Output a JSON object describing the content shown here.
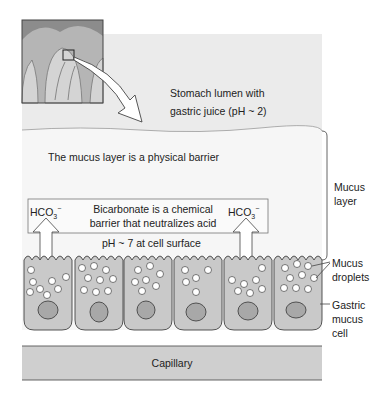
{
  "labels": {
    "lumen_line1": "Stomach lumen with",
    "lumen_line2": "gastric juice (pH ~ 2)",
    "mucus_barrier": "The mucus layer is a physical barrier",
    "bicarb_line1": "Bicarbonate is a chemical",
    "bicarb_line2": "barrier that neutralizes acid",
    "hco3_base": "HCO",
    "hco3_sub": "3",
    "hco3_sup": "−",
    "ph_surface": "pH ~ 7 at cell surface",
    "mucus_layer_line1": "Mucus",
    "mucus_layer_line2": "layer",
    "mucus_droplets_line1": "Mucus",
    "mucus_droplets_line2": "droplets",
    "gastric_cell_line1": "Gastric",
    "gastric_cell_line2": "mucus",
    "gastric_cell_line3": "cell",
    "capillary": "Capillary"
  },
  "colors": {
    "lumen_bg": "#ebebeb",
    "mucus_bg": "#f6f6f6",
    "cell_fill": "#c9c9c9",
    "nucleus_fill": "#a8a8a8",
    "capillary_fill": "#cfcfcf",
    "outline": "#444444"
  }
}
